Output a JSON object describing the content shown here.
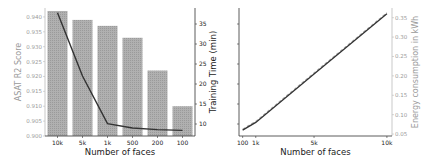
{
  "chart_data": [
    {
      "type": "bar",
      "title": "",
      "xlabel": "Number of faces",
      "ylabel": "ASAT R2 Score",
      "y2label": "Training Time (min)",
      "categories": [
        "10k",
        "5k",
        "1k",
        "500",
        "200",
        "100"
      ],
      "ylim": [
        0.9,
        0.943
      ],
      "yticks": [
        "0.900",
        "0.905",
        "0.910",
        "0.915",
        "0.920",
        "0.925",
        "0.930",
        "0.935",
        "0.940"
      ],
      "y2lim": [
        7,
        39
      ],
      "y2ticks": [
        "10",
        "15",
        "20",
        "25",
        "30",
        "35"
      ],
      "series": [
        {
          "name": "ASAT R2 Score",
          "kind": "bar",
          "axis": "left",
          "color": "#a8a8a8",
          "values": [
            0.942,
            0.939,
            0.937,
            0.933,
            0.922,
            0.91
          ]
        },
        {
          "name": "Training Time (min)",
          "kind": "line",
          "axis": "right",
          "color": "#333333",
          "values": [
            37.8,
            22.0,
            10.1,
            9.0,
            8.6,
            8.4
          ]
        }
      ],
      "grid": false,
      "legend": null
    },
    {
      "type": "line",
      "title": "",
      "xlabel": "Number of faces",
      "ylabel": "Training Time (min)",
      "y2label": "Energy consumption in kWh",
      "xticks": [
        "100",
        "1k",
        "5k",
        "10k"
      ],
      "x": [
        100,
        1000,
        5000,
        10000
      ],
      "y2lim": [
        0.045,
        0.375
      ],
      "y2ticks": [
        "0.05",
        "0.10",
        "0.15",
        "0.20",
        "0.25",
        "0.30",
        "0.35"
      ],
      "series": [
        {
          "name": "Training Time (min)",
          "kind": "line",
          "axis": "left",
          "color": "#333333",
          "style": "solid",
          "values": [
            8.4,
            10.1,
            22.0,
            37.8
          ]
        },
        {
          "name": "Energy consumption in kWh",
          "kind": "line",
          "axis": "right",
          "color": "#aaaaaa",
          "style": "dashed",
          "values": [
            0.06,
            0.08,
            0.205,
            0.36
          ]
        }
      ],
      "grid": false,
      "legend": null
    }
  ]
}
